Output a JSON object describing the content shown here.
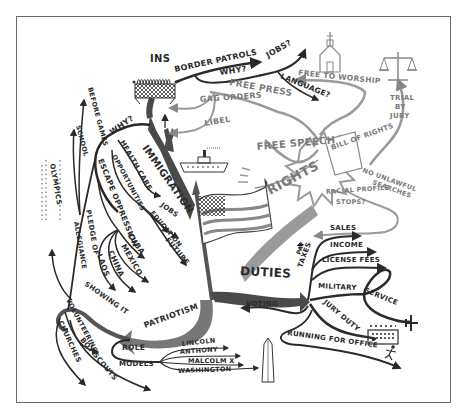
{
  "diagram": {
    "type": "mind-map",
    "center_icon": "american-flag",
    "branches": {
      "immigration": {
        "label": "IMMIGRATION",
        "ins": "INS",
        "border_patrols": "BORDER PATROLS",
        "why_top": "WHY?",
        "jobs_q": "JOBS?",
        "language_q": "LANGUAGE?",
        "why_left": "WHY?",
        "health_care": "HEALTH CARE",
        "opportunities": "OPPORTUNITIES",
        "escape_oppression": "ESCAPE OPPRESSION",
        "cuba": "CUBA",
        "mexico": "MEXICO",
        "china": "CHINA",
        "laos": "LAOS",
        "jobs": "JOBS",
        "education": "EDUCATION",
        "future": "FUTURE"
      },
      "rights": {
        "label": "RIGHTS",
        "bill_of_rights": "BILL OF RIGHTS",
        "free_to_worship": "FREE TO WORSHIP",
        "free_press": "FREE PRESS",
        "gag_orders": "GAG ORDERS",
        "libel": "LIBEL",
        "free_speech": "FREE SPEECH",
        "trial_by_jury_1": "TRIAL",
        "trial_by_jury_2": "BY",
        "trial_by_jury_3": "JURY",
        "no_unlawful_searches_1": "NO UNLAWFUL",
        "no_unlawful_searches_2": "SEARCHES",
        "racial_profile_stops_1": "RACIAL PROFILE",
        "racial_profile_stops_2": "STOPS?"
      },
      "duties": {
        "label": "DUTIES",
        "taxes": "TAXES",
        "pay": "PAY",
        "sales": "SALES",
        "income": "INCOME",
        "license_fees": "LICENSE FEES",
        "military": "MILITARY",
        "service": "SERVICE",
        "jury_duty": "JURY DUTY",
        "voting": "VOTING",
        "running_for_office": "RUNNING FOR OFFICE"
      },
      "patriotism": {
        "label": "PATRIOTISM",
        "showing_it": "SHOWING IT",
        "pledge_of": "PLEDGE OF",
        "allegiance": "ALLEGIANCE",
        "before_games": "BEFORE GAMES",
        "school": "SCHOOL",
        "olympics": "OLYMPICS",
        "volunteering": "VOLUNTEERING",
        "boy_scouts": "BOY SCOUTS",
        "churches": "CHURCHES",
        "role": "ROLE",
        "models": "MODELS",
        "lincoln": "LINCOLN",
        "anthony": "ANTHONY",
        "malcolm_x": "MALCOLM X",
        "washington": "WASHINGTON"
      }
    },
    "icons": [
      "fence-icon",
      "statue-of-liberty-icon",
      "ship-icon",
      "church-icon",
      "scales-icon",
      "scroll-icon",
      "jury-box-icon",
      "airplane-icon",
      "running-figure-icon",
      "monument-icon",
      "american-flag-icon"
    ],
    "colors": {
      "ink_dark": "#2a2a2a",
      "ink_grey": "#808080",
      "branch_fill_dark": "#4a4a4a",
      "branch_fill_grey": "#9a9a9a",
      "frame": "#6a6a6a",
      "background": "#ffffff"
    }
  }
}
